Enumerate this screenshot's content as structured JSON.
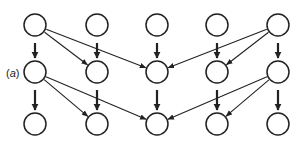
{
  "panel_label": {
    "open": "(",
    "letter": "a",
    "close": ")"
  },
  "colors": {
    "stroke": "#222222",
    "background": "#ffffff"
  },
  "node_radius": 11,
  "columns_x": [
    35,
    97,
    157,
    217,
    278
  ],
  "rows_y": [
    25,
    72,
    124
  ],
  "nodes": [
    {
      "id": "r0c0",
      "row": 0,
      "col": 0
    },
    {
      "id": "r0c1",
      "row": 0,
      "col": 1
    },
    {
      "id": "r0c2",
      "row": 0,
      "col": 2
    },
    {
      "id": "r0c3",
      "row": 0,
      "col": 3
    },
    {
      "id": "r0c4",
      "row": 0,
      "col": 4
    },
    {
      "id": "r1c0",
      "row": 1,
      "col": 0
    },
    {
      "id": "r1c1",
      "row": 1,
      "col": 1
    },
    {
      "id": "r1c2",
      "row": 1,
      "col": 2
    },
    {
      "id": "r1c3",
      "row": 1,
      "col": 3
    },
    {
      "id": "r1c4",
      "row": 1,
      "col": 4
    },
    {
      "id": "r2c0",
      "row": 2,
      "col": 0
    },
    {
      "id": "r2c1",
      "row": 2,
      "col": 1
    },
    {
      "id": "r2c2",
      "row": 2,
      "col": 2
    },
    {
      "id": "r2c3",
      "row": 2,
      "col": 3
    },
    {
      "id": "r2c4",
      "row": 2,
      "col": 4
    }
  ],
  "edges": [
    {
      "from": "r0c0",
      "to": "r1c0",
      "type": "vertical"
    },
    {
      "from": "r0c1",
      "to": "r1c1",
      "type": "vertical"
    },
    {
      "from": "r0c2",
      "to": "r1c2",
      "type": "vertical"
    },
    {
      "from": "r0c3",
      "to": "r1c3",
      "type": "vertical"
    },
    {
      "from": "r0c4",
      "to": "r1c4",
      "type": "vertical"
    },
    {
      "from": "r0c0",
      "to": "r1c1",
      "type": "diagonal"
    },
    {
      "from": "r0c0",
      "to": "r1c2",
      "type": "diagonal"
    },
    {
      "from": "r0c4",
      "to": "r1c2",
      "type": "diagonal"
    },
    {
      "from": "r0c4",
      "to": "r1c3",
      "type": "diagonal"
    },
    {
      "from": "r1c0",
      "to": "r2c0",
      "type": "vertical"
    },
    {
      "from": "r1c1",
      "to": "r2c1",
      "type": "vertical"
    },
    {
      "from": "r1c2",
      "to": "r2c2",
      "type": "vertical"
    },
    {
      "from": "r1c3",
      "to": "r2c3",
      "type": "vertical"
    },
    {
      "from": "r1c4",
      "to": "r2c4",
      "type": "vertical"
    },
    {
      "from": "r1c0",
      "to": "r2c1",
      "type": "diagonal"
    },
    {
      "from": "r1c0",
      "to": "r2c2",
      "type": "diagonal"
    },
    {
      "from": "r1c4",
      "to": "r2c2",
      "type": "diagonal"
    },
    {
      "from": "r1c4",
      "to": "r2c3",
      "type": "diagonal"
    }
  ]
}
